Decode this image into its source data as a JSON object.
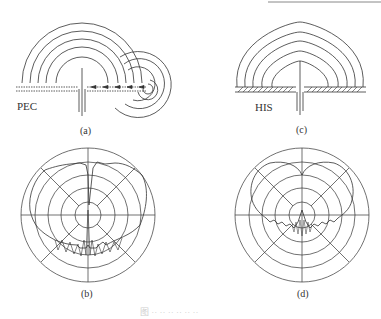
{
  "figure": {
    "panels": [
      {
        "id": "a",
        "caption": "(a)",
        "surface_label": "PEC",
        "description": "Monopole over PEC ground plane with surface waves"
      },
      {
        "id": "b",
        "caption": "(b)",
        "description": "Radiation pattern over PEC"
      },
      {
        "id": "c",
        "caption": "(c)",
        "surface_label": "HIS",
        "description": "Monopole over high-impedance surface"
      },
      {
        "id": "d",
        "caption": "(d)",
        "description": "Radiation pattern over HIS"
      }
    ],
    "figure_caption": "图 ·· ·· ·· ·· ·· ··",
    "line_color": "#333333"
  }
}
